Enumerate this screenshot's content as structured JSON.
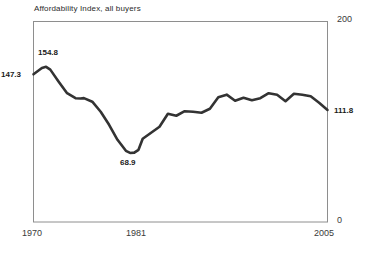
{
  "chart_data": {
    "type": "line",
    "title": "Affordability Index, all buyers",
    "xlabel": "",
    "ylabel": "",
    "ylim": [
      0,
      200
    ],
    "xlim": [
      1970,
      2005
    ],
    "grid": false,
    "legend": null,
    "y_ticks": [
      "0",
      "200"
    ],
    "x_ticks": [
      "1970",
      "1981",
      "2005"
    ],
    "line_color": "#333333",
    "annotations": [
      {
        "name": "start-value",
        "text": "147.3",
        "x": 1970,
        "y": 147.3
      },
      {
        "name": "peak-value",
        "text": "154.8",
        "x": 1971.5,
        "y": 154.8
      },
      {
        "name": "trough-value",
        "text": "68.9",
        "x": 1981.5,
        "y": 68.9
      },
      {
        "name": "end-value",
        "text": "111.8",
        "x": 2005,
        "y": 111.8
      }
    ],
    "x": [
      1970,
      1971,
      1971.5,
      1972,
      1973,
      1974,
      1975,
      1975.6,
      1976,
      1977,
      1978,
      1979,
      1980,
      1981,
      1981.5,
      1982,
      1982.5,
      1983,
      1984,
      1985,
      1986,
      1987,
      1988,
      1989,
      1990,
      1991,
      1992,
      1993,
      1994,
      1995,
      1996,
      1997,
      1998,
      1999,
      2000,
      2001,
      2002,
      2003,
      2004,
      2005
    ],
    "values": [
      147.3,
      153.6,
      154.8,
      152.0,
      140.0,
      128.5,
      123.5,
      123.2,
      123.6,
      120.0,
      110.0,
      97.0,
      82.0,
      71.0,
      68.9,
      69.2,
      72.0,
      83.0,
      89.0,
      95.0,
      108.0,
      106.0,
      110.5,
      110.0,
      109.0,
      113.0,
      124.5,
      127.0,
      121.0,
      124.0,
      121.5,
      123.5,
      128.5,
      127.0,
      120.5,
      128.0,
      127.0,
      125.5,
      119.0,
      111.8
    ]
  },
  "title": "Affordability Index, all buyers",
  "axes": {
    "y_top": "200",
    "y_bottom": "0",
    "x_start": "1970",
    "x_mid": "1981",
    "x_end": "2005"
  },
  "labels": {
    "start": "147.3",
    "peak": "154.8",
    "trough": "68.9",
    "end": "111.8"
  }
}
